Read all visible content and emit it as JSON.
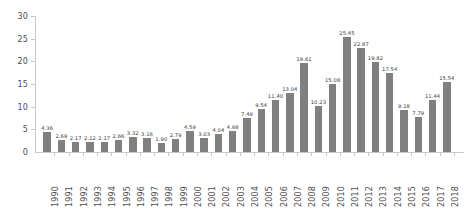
{
  "chart_data": {
    "type": "bar",
    "title": "",
    "subtitle": "",
    "xlabel": "",
    "ylabel": "",
    "ylim": [
      0,
      30
    ],
    "yticks": [
      0,
      5,
      10,
      15,
      20,
      25,
      30
    ],
    "ytick_labels": [
      "0",
      "5",
      "10",
      "15",
      "20",
      "25",
      "30"
    ],
    "grid": false,
    "legend": false,
    "legend_position": "none",
    "bar_color": "#808080",
    "axis_color": "#c8c8c8",
    "label_color": "#4d4d4d",
    "value_label_color": "#3a3a3a",
    "xtick_rotation": 90,
    "categories": [
      "1990",
      "1991",
      "1992",
      "1993",
      "1994",
      "1995",
      "1996",
      "1997",
      "1998",
      "1999",
      "2000",
      "2001",
      "2002",
      "2003",
      "2004",
      "2005",
      "2006",
      "2007",
      "2008",
      "2009",
      "2010",
      "2011",
      "2012",
      "2013",
      "2014",
      "2015",
      "2016",
      "2017",
      "2018"
    ],
    "values": [
      4.36,
      2.69,
      2.17,
      2.12,
      2.17,
      2.66,
      3.32,
      3.16,
      1.9,
      2.79,
      4.59,
      3.03,
      4.04,
      4.68,
      7.49,
      9.54,
      11.4,
      13.04,
      19.61,
      10.23,
      15.08,
      25.45,
      22.87,
      19.82,
      17.54,
      9.18,
      7.79,
      11.44,
      15.54
    ],
    "value_labels": [
      "4.36",
      "2.69",
      "2.17",
      "2.12",
      "2.17",
      "2.66",
      "3.32",
      "3.16",
      "1.90",
      "2.79",
      "4.59",
      "3.03",
      "4.04",
      "4.68",
      "7.49",
      "9.54",
      "11.40",
      "13.04",
      "19.61",
      "10.23",
      "15.08",
      "25.45",
      "22.87",
      "19.82",
      "17.54",
      "9.18",
      "7.79",
      "11.44",
      "15.54"
    ]
  }
}
